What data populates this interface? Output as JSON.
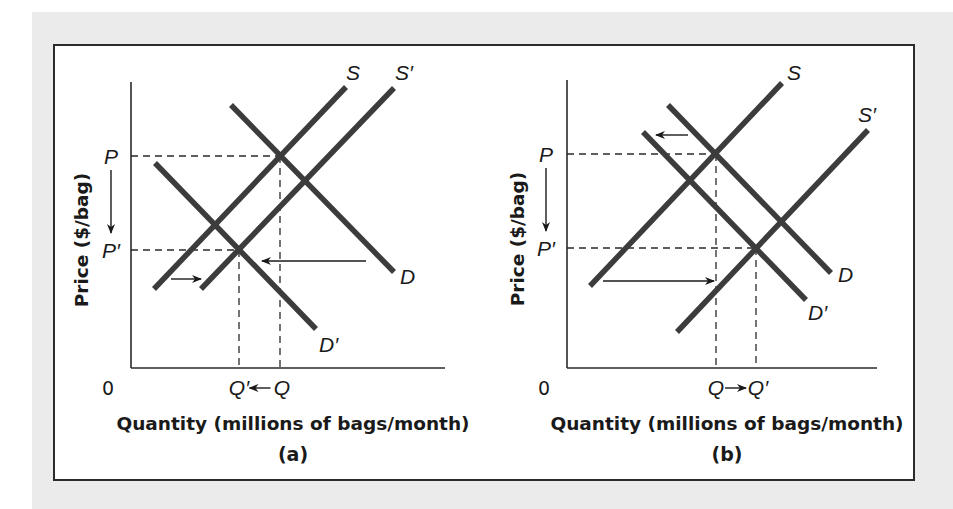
{
  "figure": {
    "frame_color": "#ebebeb",
    "curve_color": "#3c3c3c"
  },
  "panels": [
    {
      "id": "a",
      "caption": "(a)",
      "y_axis_label": "Price ($/bag)",
      "x_axis_label": "Quantity (millions of bags/month)",
      "origin_label": "0",
      "axis": {
        "x0": 131,
        "y_top": 82,
        "y0": 368,
        "x_end": 445
      },
      "price_labels": {
        "P": "P",
        "P_prime": "P′",
        "P_y": 156,
        "P_prime_y": 250
      },
      "quantity_labels": {
        "left": "Q′",
        "right": "Q",
        "arrow": "←",
        "Q_x": 280,
        "Q_prime_x": 239
      },
      "curves": [
        {
          "name": "S",
          "label": "S",
          "x1": 154,
          "y1": 289,
          "x2": 346,
          "y2": 87,
          "lx": 346,
          "ly": 80
        },
        {
          "name": "S-prime",
          "label": "S′",
          "x1": 201,
          "y1": 289,
          "x2": 394,
          "y2": 88,
          "lx": 395,
          "ly": 80
        },
        {
          "name": "D",
          "label": "D",
          "x1": 231,
          "y1": 105,
          "x2": 394,
          "y2": 272,
          "lx": 400,
          "ly": 284
        },
        {
          "name": "D-prime",
          "label": "D′",
          "x1": 155,
          "y1": 163,
          "x2": 316,
          "y2": 329,
          "lx": 319,
          "ly": 352
        }
      ],
      "dashes": [
        {
          "x1": 131,
          "y1": 156,
          "x2": 280,
          "y2": 156
        },
        {
          "x1": 280,
          "y1": 156,
          "x2": 280,
          "y2": 368
        },
        {
          "x1": 131,
          "y1": 250,
          "x2": 239,
          "y2": 250
        },
        {
          "x1": 239,
          "y1": 250,
          "x2": 239,
          "y2": 368
        }
      ],
      "shift_arrows": [
        {
          "x1": 171,
          "y1": 279,
          "x2": 201,
          "y2": 279
        },
        {
          "x1": 366,
          "y1": 261,
          "x2": 262,
          "y2": 261
        }
      ],
      "price_arrow": {
        "x": 111,
        "y1": 170,
        "y2": 233
      }
    },
    {
      "id": "b",
      "caption": "(b)",
      "y_axis_label": "Price ($/bag)",
      "x_axis_label": "Quantity (millions of bags/month)",
      "origin_label": "0",
      "axis": {
        "x0": 567,
        "y_top": 80,
        "y0": 368,
        "x_end": 877
      },
      "price_labels": {
        "P": "P",
        "P_prime": "P′",
        "P_y": 154,
        "P_prime_y": 248
      },
      "quantity_labels": {
        "left": "Q",
        "right": "Q′",
        "arrow": "→",
        "Q_x": 716,
        "Q_prime_x": 756
      },
      "curves": [
        {
          "name": "S",
          "label": "S",
          "x1": 590,
          "y1": 286,
          "x2": 782,
          "y2": 83,
          "lx": 787,
          "ly": 80
        },
        {
          "name": "S-prime",
          "label": "S′",
          "x1": 677,
          "y1": 332,
          "x2": 868,
          "y2": 130,
          "lx": 858,
          "ly": 122
        },
        {
          "name": "D",
          "label": "D",
          "x1": 668,
          "y1": 105,
          "x2": 831,
          "y2": 273,
          "lx": 838,
          "ly": 282
        },
        {
          "name": "D-prime",
          "label": "D′",
          "x1": 643,
          "y1": 132,
          "x2": 806,
          "y2": 300,
          "lx": 808,
          "ly": 320
        }
      ],
      "dashes": [
        {
          "x1": 567,
          "y1": 154,
          "x2": 715,
          "y2": 154
        },
        {
          "x1": 716,
          "y1": 154,
          "x2": 716,
          "y2": 368
        },
        {
          "x1": 567,
          "y1": 248,
          "x2": 756,
          "y2": 248
        },
        {
          "x1": 756,
          "y1": 248,
          "x2": 756,
          "y2": 368
        }
      ],
      "shift_arrows": [
        {
          "x1": 688,
          "y1": 135,
          "x2": 656,
          "y2": 135
        },
        {
          "x1": 603,
          "y1": 281,
          "x2": 714,
          "y2": 281
        }
      ],
      "price_arrow": {
        "x": 546,
        "y1": 168,
        "y2": 231
      }
    }
  ],
  "chart_data": [
    {
      "type": "line",
      "title": "(a)",
      "xlabel": "Quantity (millions of bags/month)",
      "ylabel": "Price ($/bag)",
      "grid": false,
      "series": [
        {
          "name": "S",
          "kind": "supply",
          "points": [
            [
              0.07,
              0.28
            ],
            [
              0.68,
              0.98
            ]
          ]
        },
        {
          "name": "S′",
          "kind": "supply",
          "points": [
            [
              0.22,
              0.28
            ],
            [
              0.84,
              0.98
            ]
          ]
        },
        {
          "name": "D",
          "kind": "demand",
          "points": [
            [
              0.32,
              0.92
            ],
            [
              0.84,
              0.34
            ]
          ]
        },
        {
          "name": "D′",
          "kind": "demand",
          "points": [
            [
              0.08,
              0.72
            ],
            [
              0.59,
              0.14
            ]
          ]
        }
      ],
      "annotations": [
        "P",
        "P′",
        "Q′ ← Q",
        "0",
        "supply shifts right (S → S′)",
        "demand shifts left (D → D′)",
        "price falls P → P′"
      ],
      "equilibria": {
        "initial": {
          "label": "P, Q",
          "x": 0.47,
          "y": 0.74
        },
        "new": {
          "label": "P′, Q′",
          "x": 0.34,
          "y": 0.41
        }
      }
    },
    {
      "type": "line",
      "title": "(b)",
      "xlabel": "Quantity (millions of bags/month)",
      "ylabel": "Price ($/bag)",
      "grid": false,
      "series": [
        {
          "name": "S",
          "kind": "supply",
          "points": [
            [
              0.07,
              0.29
            ],
            [
              0.7,
              1.0
            ]
          ]
        },
        {
          "name": "S′",
          "kind": "supply",
          "points": [
            [
              0.35,
              0.13
            ],
            [
              0.97,
              0.83
            ]
          ]
        },
        {
          "name": "D",
          "kind": "demand",
          "points": [
            [
              0.33,
              0.92
            ],
            [
              0.85,
              0.33
            ]
          ]
        },
        {
          "name": "D′",
          "kind": "demand",
          "points": [
            [
              0.25,
              0.82
            ],
            [
              0.77,
              0.24
            ]
          ]
        }
      ],
      "annotations": [
        "P",
        "P′",
        "Q → Q′",
        "0",
        "supply shifts right (S → S′)",
        "demand shifts left (D → D′)",
        "price falls P → P′"
      ],
      "equilibria": {
        "initial": {
          "label": "P, Q",
          "x": 0.48,
          "y": 0.75
        },
        "new": {
          "label": "P′, Q′",
          "x": 0.61,
          "y": 0.42
        }
      }
    }
  ]
}
